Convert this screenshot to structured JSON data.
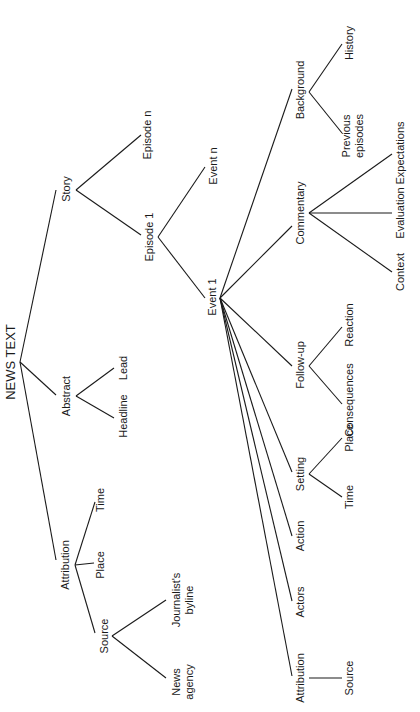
{
  "diagram": {
    "title": "NEWS TEXT",
    "nodes": {
      "root": "NEWS TEXT",
      "attribution": "Attribution",
      "attr_source": "Source",
      "attr_place": "Place",
      "attr_time": "Time",
      "news_agency_1": "News",
      "news_agency_2": "agency",
      "journalist_1": "Journalist's",
      "journalist_2": "byline",
      "abstract": "Abstract",
      "headline": "Headline",
      "lead": "Lead",
      "story": "Story",
      "episode_1": "Episode 1",
      "episode_n": "Episode n",
      "event_1": "Event 1",
      "event_n": "Event n",
      "ev_attribution": "Attribution",
      "ev_source": "Source",
      "actors": "Actors",
      "action": "Action",
      "setting": "Setting",
      "set_time": "Time",
      "set_place": "Place",
      "followup": "Follow-up",
      "consequences": "Consequences",
      "reaction": "Reaction",
      "commentary": "Commentary",
      "context": "Context",
      "evaluation": "Evaluation",
      "expectations": "Expectations",
      "background": "Background",
      "previous_1": "Previous",
      "previous_2": "episodes",
      "history": "History"
    }
  }
}
